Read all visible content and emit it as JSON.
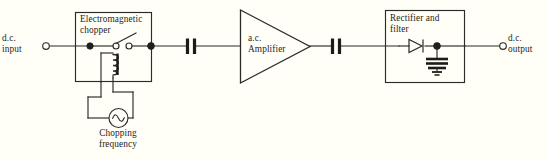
{
  "diagram": {
    "background_color": "#fffff8",
    "line_color": "#2b2b28",
    "blocks": {
      "chopper": {
        "label": "Electromagnetic\nchopper"
      },
      "amplifier": {
        "label": "a.c.\nAmplifier"
      },
      "rectifier": {
        "label": "Rectifier and\nfilter"
      }
    },
    "terminals": {
      "input": {
        "label": "d.c.\ninput"
      },
      "output": {
        "label": "d.c.\noutput"
      }
    },
    "source": {
      "label": "Chopping\nfrequency",
      "symbol": "sine-source"
    },
    "components": {
      "coupling_capacitor_1": "capacitor",
      "coupling_capacitor_2": "capacitor",
      "diode": "diode",
      "filter_capacitor": "capacitor",
      "ground": "earth-ground",
      "relay_coil": "inductor-coil",
      "switch": "spst-switch"
    }
  }
}
